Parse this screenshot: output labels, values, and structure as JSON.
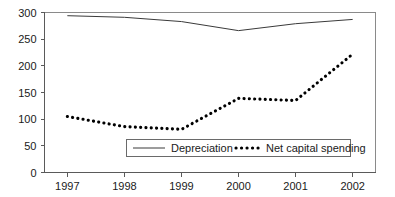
{
  "chart_data": {
    "type": "line",
    "title": "",
    "xlabel": "",
    "ylabel": "",
    "categories": [
      "1997",
      "1998",
      "1999",
      "2000",
      "2001",
      "2002"
    ],
    "x": [
      1997,
      1998,
      1999,
      2000,
      2001,
      2002
    ],
    "xlim": [
      1996.6,
      2002.4
    ],
    "ylim": [
      0,
      300
    ],
    "yticks": [
      0,
      50,
      100,
      150,
      200,
      250,
      300
    ],
    "ytick_labels": [
      "0",
      "50",
      "100",
      "150",
      "200",
      "250",
      "300"
    ],
    "xtick_labels": [
      "1997",
      "1998",
      "1999",
      "2000",
      "2001",
      "2002"
    ],
    "grid": false,
    "legend_position": "lower center",
    "series": [
      {
        "name": "Depreciation",
        "style": "solid",
        "color": "#3a3a3a",
        "values": [
          294,
          291,
          283,
          266,
          279,
          287
        ]
      },
      {
        "name": "Net capital spending",
        "style": "dotted",
        "color": "#000000",
        "values": [
          105,
          86,
          81,
          139,
          135,
          222
        ]
      }
    ]
  },
  "legend": {
    "items": [
      {
        "label": "Depreciation",
        "style": "solid"
      },
      {
        "label": "Net capital spending",
        "style": "dotted"
      }
    ]
  },
  "axes": {
    "y_tick_labels": [
      "300",
      "250",
      "200",
      "150",
      "100",
      "50",
      "0"
    ],
    "x_tick_labels": [
      "1997",
      "1998",
      "1999",
      "2000",
      "2001",
      "2002"
    ]
  }
}
